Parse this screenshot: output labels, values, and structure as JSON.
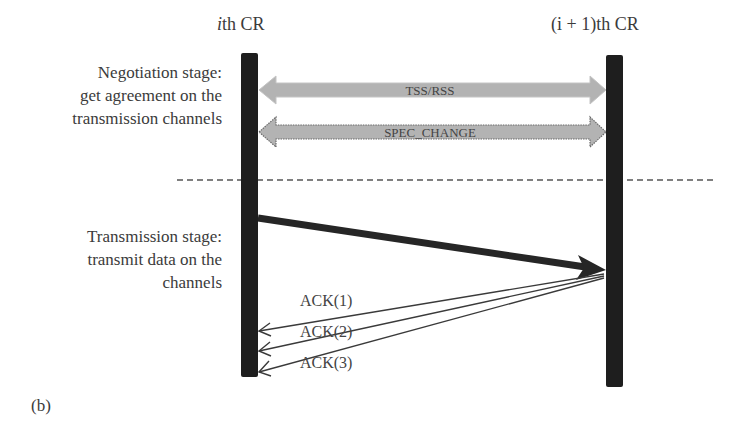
{
  "figure_label": "(b)",
  "nodes": {
    "left": {
      "prefix": "i",
      "suffix": "th CR"
    },
    "right": {
      "prefix": "(i + 1)",
      "suffix": "th CR"
    }
  },
  "stages": {
    "negotiation": {
      "line1": "Negotiation stage:",
      "line2": "get agreement on the",
      "line3": "transmission channels"
    },
    "transmission": {
      "line1": "Transmission stage:",
      "line2": "transmit data on the",
      "line3": "channels"
    }
  },
  "messages": {
    "tss_rss": "TSS/RSS",
    "spec_change": "SPEC_CHANGE",
    "acks": [
      "ACK(1)",
      "ACK(2)",
      "ACK(3)"
    ]
  },
  "colors": {
    "lifeline": "#1e1e1e",
    "negotiation_arrow": "#b3b3b3",
    "arrow_outline": "#6a6a6a",
    "data_arrow": "#262626",
    "dashed_separator": "#555555"
  }
}
